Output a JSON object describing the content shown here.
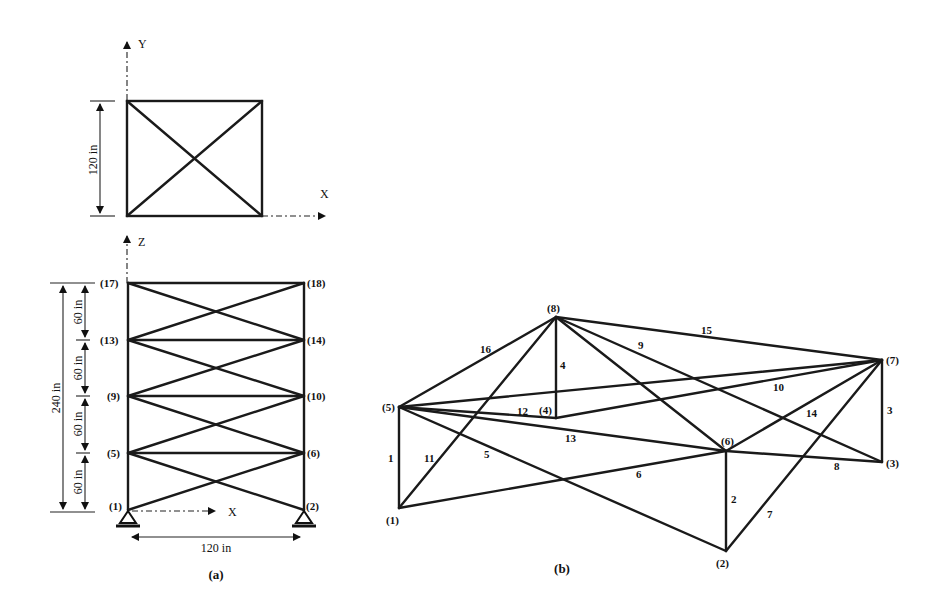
{
  "figure_a": {
    "caption": "(a)",
    "plan_view": {
      "axis_y": "Y",
      "axis_x": "X",
      "dimension": "120 in"
    },
    "elevation_view": {
      "axis_z": "Z",
      "axis_x": "X",
      "total_height": "240 in",
      "story_heights": [
        "60 in",
        "60 in",
        "60 in",
        "60 in"
      ],
      "width": "120 in",
      "nodes": {
        "n17": "(17)",
        "n18": "(18)",
        "n13": "(13)",
        "n14": "(14)",
        "n9": "(9)",
        "n10": "(10)",
        "n5": "(5)",
        "n6": "(6)",
        "n1": "(1)",
        "n2": "(2)"
      }
    }
  },
  "figure_b": {
    "caption": "(b)",
    "nodes": {
      "n1": "(1)",
      "n2": "(2)",
      "n3": "(3)",
      "n4": "(4)",
      "n5": "(5)",
      "n6": "(6)",
      "n7": "(7)",
      "n8": "(8)"
    },
    "members": {
      "m1": "1",
      "m2": "2",
      "m3": "3",
      "m4": "4",
      "m5": "5",
      "m6": "6",
      "m7": "7",
      "m8": "8",
      "m9": "9",
      "m10": "10",
      "m11": "11",
      "m12": "12",
      "m13": "13",
      "m14": "14",
      "m15": "15",
      "m16": "16"
    }
  }
}
